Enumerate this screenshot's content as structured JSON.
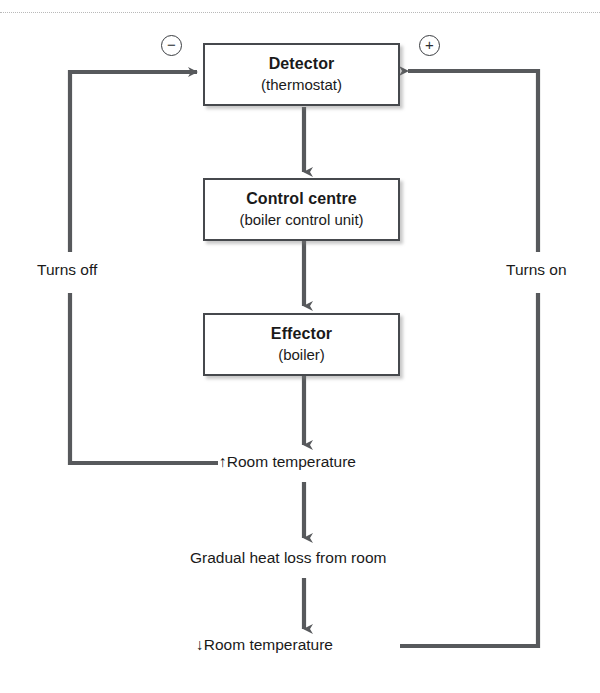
{
  "diagram": {
    "top_rule": "dotted-divider",
    "boxes": [
      {
        "name": "detector",
        "title": "Detector",
        "subtitle": "(thermostat)"
      },
      {
        "name": "control-centre",
        "title": "Control centre",
        "subtitle": "(boiler control unit)"
      },
      {
        "name": "effector",
        "title": "Effector",
        "subtitle": "(boiler)"
      }
    ],
    "labels": {
      "room_temp_up": "↑Room temperature",
      "heat_loss": "Gradual heat loss from room",
      "room_temp_down": "↓Room temperature",
      "turns_off": "Turns off",
      "turns_on": "Turns on"
    },
    "signs": {
      "negative": "−",
      "negative_name": "minus-circle-icon",
      "positive": "+",
      "positive_name": "plus-circle-icon"
    },
    "colors": {
      "box_border": "#46494d",
      "box_fill": "#ffffff",
      "arrow": "#57595c",
      "text": "#1a1a1a",
      "rule": "#b9b9b9"
    }
  }
}
